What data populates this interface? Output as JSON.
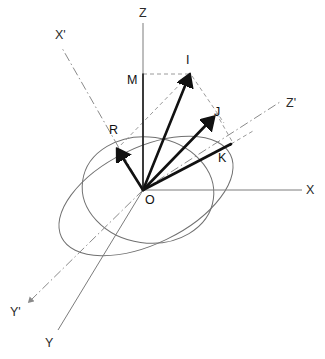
{
  "figure": {
    "background_color": "#ffffff",
    "width": 325,
    "height": 359,
    "origin": {
      "x": 143,
      "y": 190
    }
  },
  "colors": {
    "axis": "#7c7c7c",
    "axis_prime": "#8a8a8a",
    "vector": "#111111",
    "construction": "#9a9a9a",
    "ellipse": "#707070",
    "label": "#2a2a2a"
  },
  "axes": [
    {
      "name": "Z",
      "label": "Z",
      "style": "solid",
      "label_x": 139,
      "label_y": 17,
      "x1": 143,
      "y1": 23,
      "x2": 143,
      "y2": 190
    },
    {
      "name": "X",
      "label": "X",
      "style": "solid",
      "label_x": 306,
      "label_y": 193,
      "x1": 143,
      "y1": 190,
      "x2": 302,
      "y2": 190
    },
    {
      "name": "Y",
      "label": "Y",
      "style": "solid",
      "label_x": 45,
      "label_y": 345,
      "x1": 143,
      "y1": 190,
      "x2": 58,
      "y2": 330
    },
    {
      "name": "X-prime",
      "label": "X'",
      "style": "dash-dot",
      "label_x": 56,
      "label_y": 39,
      "x1": 62,
      "y1": 48,
      "x2": 143,
      "y2": 190
    },
    {
      "name": "Y-prime",
      "label": "Y'",
      "style": "dash-dot",
      "label_x": 12,
      "label_y": 314,
      "x1": 143,
      "y1": 190,
      "x2": 27,
      "y2": 303
    },
    {
      "name": "Z-prime",
      "label": "Z'",
      "style": "dash-dot",
      "label_x": 287,
      "label_y": 106,
      "x1": 143,
      "y1": 190,
      "x2": 282,
      "y2": 101
    }
  ],
  "points": [
    {
      "name": "O",
      "label": "O",
      "x": 143,
      "y": 190,
      "label_x": 145,
      "label_y": 203
    },
    {
      "name": "I",
      "label": "I",
      "x": 190,
      "y": 74,
      "label_x": 187,
      "label_y": 63
    },
    {
      "name": "M",
      "label": "M",
      "x": 143,
      "y": 74,
      "label_x": 128,
      "label_y": 83
    },
    {
      "name": "R",
      "label": "R",
      "x": 118,
      "y": 150,
      "label_x": 111,
      "label_y": 133
    },
    {
      "name": "J",
      "label": "J",
      "x": 212,
      "y": 118,
      "label_x": 215,
      "label_y": 115
    },
    {
      "name": "K",
      "label": "K",
      "x": 226,
      "y": 149,
      "label_x": 219,
      "label_y": 161
    }
  ],
  "vectors": [
    {
      "name": "OI",
      "from": "O",
      "to": "I",
      "weight": "bold",
      "arrow": true,
      "x1": 143,
      "y1": 190,
      "x2": 190,
      "y2": 74
    },
    {
      "name": "OR",
      "from": "O",
      "to": "R",
      "weight": "bold",
      "arrow": true,
      "x1": 143,
      "y1": 190,
      "x2": 118,
      "y2": 150
    },
    {
      "name": "OJ",
      "from": "O",
      "to": "J",
      "weight": "bold",
      "arrow": true,
      "x1": 143,
      "y1": 190,
      "x2": 212,
      "y2": 118
    },
    {
      "name": "OK",
      "from": "O",
      "to": "K",
      "weight": "bold",
      "arrow": false,
      "x1": 143,
      "y1": 190,
      "x2": 230,
      "y2": 145
    },
    {
      "name": "OM",
      "from": "O",
      "to": "M",
      "weight": "thin",
      "arrow": false,
      "x1": 143,
      "y1": 190,
      "x2": 143,
      "y2": 74
    }
  ],
  "construction_lines": [
    {
      "name": "M-to-I",
      "x1": 143,
      "y1": 74,
      "x2": 190,
      "y2": 74
    },
    {
      "name": "I-to-J",
      "x1": 190,
      "y1": 74,
      "x2": 222,
      "y2": 121
    },
    {
      "name": "J-to-K",
      "x1": 217,
      "y1": 114,
      "x2": 232,
      "y2": 142
    },
    {
      "name": "R-to-I",
      "x1": 118,
      "y1": 150,
      "x2": 190,
      "y2": 74
    },
    {
      "name": "R-to-O-ext",
      "x1": 115,
      "y1": 147,
      "x2": 143,
      "y2": 190
    },
    {
      "name": "K-to-Zprime",
      "x1": 231,
      "y1": 144,
      "x2": 251,
      "y2": 132
    }
  ],
  "curves": [
    {
      "name": "main-ellipse",
      "type": "ellipse",
      "cx": 146,
      "cy": 196,
      "rx": 94,
      "ry": 48,
      "rotation": -26
    },
    {
      "name": "secondary-arc",
      "type": "ellipse",
      "cx": 148,
      "cy": 190,
      "rx": 66,
      "ry": 53,
      "rotation": 8
    }
  ]
}
